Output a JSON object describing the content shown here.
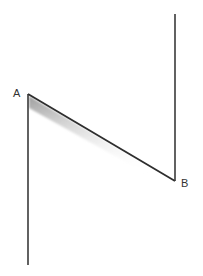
{
  "diagram": {
    "labels": {
      "a": "A",
      "b": "B"
    },
    "points": {
      "A": {
        "x": 28,
        "y": 94
      },
      "B": {
        "x": 175,
        "y": 181
      }
    },
    "lines": [
      {
        "name": "left-vertical",
        "from": [
          28,
          94
        ],
        "to": [
          28,
          265
        ]
      },
      {
        "name": "diagonal",
        "from": [
          28,
          94
        ],
        "to": [
          175,
          181
        ]
      },
      {
        "name": "right-vertical",
        "from": [
          175,
          181
        ],
        "to": [
          175,
          14
        ]
      }
    ],
    "colors": {
      "line": "#3a3a3a",
      "shadow": "#9a9a9a",
      "background": "#ffffff",
      "label": "#333333"
    }
  }
}
